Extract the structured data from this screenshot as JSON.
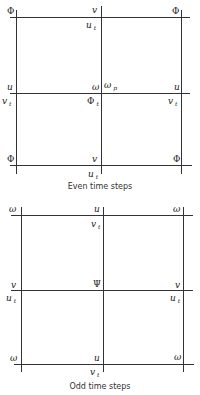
{
  "even": {
    "caption": "Even time steps",
    "labels": {
      "tl": "Φ",
      "tm": "v",
      "tr": "Φ",
      "tm_below": "u",
      "tm_below_sub": "t",
      "ml": "u",
      "mm": "ω",
      "mm_right": "ω",
      "mm_right_sub": "p",
      "mr": "u",
      "ml_below": "v",
      "ml_below_sub": "t",
      "mm_below": "Φ",
      "mm_below_sub": "t",
      "mr_below": "v",
      "mr_below_sub": "t",
      "bl": "Φ",
      "bm": "v",
      "br": "Φ",
      "bm_below": "u",
      "bm_below_sub": "t"
    }
  },
  "odd": {
    "caption": "Odd time steps",
    "labels": {
      "tl": "ω",
      "tm": "u",
      "tr": "ω",
      "tm_below": "v",
      "tm_below_sub": "t",
      "ml": "v",
      "mm": "Ψ",
      "mr": "v",
      "ml_below": "u",
      "ml_below_sub": "t",
      "mr_below": "u",
      "mr_below_sub": "t",
      "bl": "ω",
      "bm": "u",
      "br": "ω",
      "bm_below": "v",
      "bm_below_sub": "t"
    }
  }
}
